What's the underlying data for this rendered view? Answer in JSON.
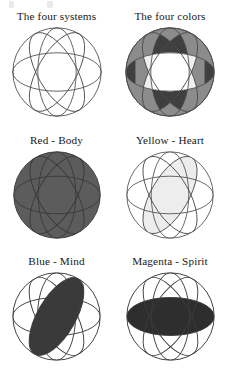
{
  "figure": {
    "title_text_visible": false,
    "panel_count": 6,
    "columns": 2,
    "rows": 3
  },
  "panels": [
    {
      "id": "four-systems",
      "caption": "The four systems",
      "fill_mode": "none",
      "fill_color": "#ffffff",
      "outline_color": "#4d4d4d",
      "sphere_fill": "#ffffff",
      "highlight_ellipse": null
    },
    {
      "id": "four-colors",
      "caption": "The four colors",
      "fill_mode": "all-lenses",
      "fill_color": "#7a7a7a",
      "outline_color": "#4d4d4d",
      "sphere_fill": "#8a8a8a",
      "highlight_ellipse": "all"
    },
    {
      "id": "red-body",
      "caption": "Red - Body",
      "fill_mode": "whole-sphere",
      "fill_color": "#5c5c5c",
      "outline_color": "#3b3b3b",
      "sphere_fill": "#5c5c5c",
      "highlight_ellipse": "sphere"
    },
    {
      "id": "yellow-heart",
      "caption": "Yellow - Heart",
      "fill_mode": "single-ellipse",
      "fill_color": "#ececec",
      "outline_color": "#4d4d4d",
      "sphere_fill": "#ffffff",
      "highlight_ellipse": "rot-120"
    },
    {
      "id": "blue-mind",
      "caption": "Blue - Mind",
      "fill_mode": "single-ellipse",
      "fill_color": "#3a3a3a",
      "outline_color": "#3b3b3b",
      "sphere_fill": "#ffffff",
      "highlight_ellipse": "rot-60"
    },
    {
      "id": "magenta-spirit",
      "caption": "Magenta - Spirit",
      "fill_mode": "single-ellipse",
      "fill_color": "#2e2e2e",
      "outline_color": "#3b3b3b",
      "sphere_fill": "#ffffff",
      "highlight_ellipse": "horizontal"
    }
  ],
  "geometry": {
    "ellipse_rotations_deg": [
      0,
      60,
      120,
      90
    ],
    "ellipse_rx_ratio": 0.47,
    "ellipse_ry_ratio": 0.22,
    "note": "Each sphere is a circle containing four ellipses representing the four systems."
  },
  "colors": {
    "page_background": "#ffffff",
    "text": "#171717",
    "line": "#4d4d4d",
    "dark_fill": "#3a3a3a",
    "mid_fill": "#7a7a7a",
    "light_fill": "#ececec"
  }
}
